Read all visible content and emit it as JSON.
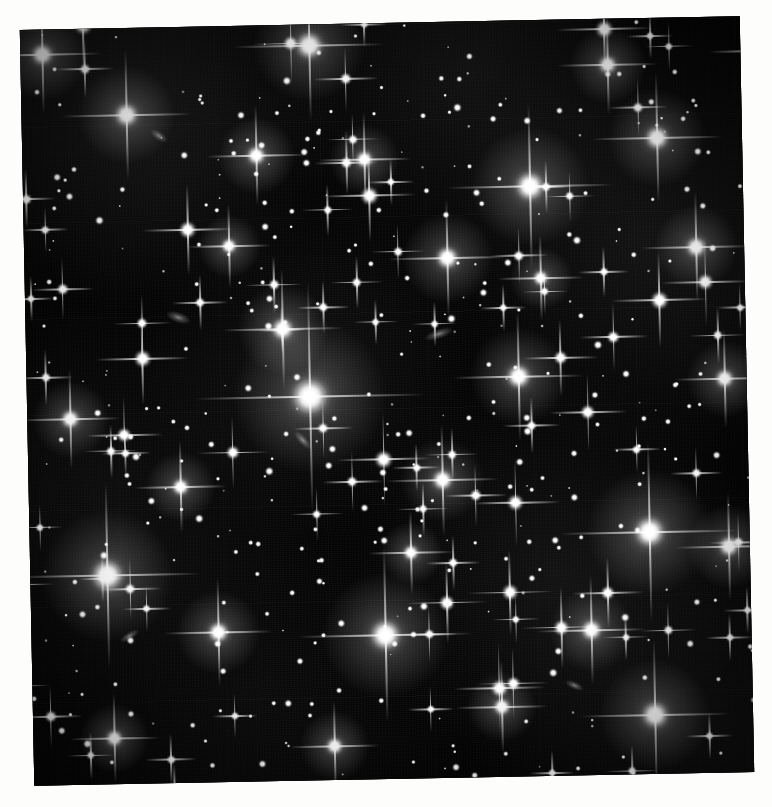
{
  "media": {
    "kind": "astronomical-photograph",
    "subject": "dense globular star cluster field",
    "caption": "",
    "border_color": "#fdfdfc",
    "sky_color": "#030303",
    "star_color": "#ffffff",
    "rotation_degrees": -1.1,
    "plate": {
      "left": 27,
      "top": 23,
      "width": 720,
      "height": 756
    }
  },
  "chart_data": {
    "type": "scatter",
    "title": "",
    "xlabel": "",
    "ylabel": "",
    "xlim": [
      0,
      748
    ],
    "ylim": [
      0,
      780
    ],
    "grid": false,
    "legend": "none",
    "series": [
      {
        "name": "bright stars with diffraction spikes",
        "points": [
          {
            "x": 303,
            "y": 31,
            "r": 16,
            "spike": 150
          },
          {
            "x": 521,
            "y": 176,
            "r": 17,
            "spike": 165
          },
          {
            "x": 297,
            "y": 382,
            "r": 22,
            "spike": 230
          },
          {
            "x": 91,
            "y": 557,
            "r": 19,
            "spike": 185
          },
          {
            "x": 368,
            "y": 622,
            "r": 18,
            "spike": 175
          },
          {
            "x": 634,
            "y": 524,
            "r": 18,
            "spike": 180
          },
          {
            "x": 636,
            "y": 707,
            "r": 16,
            "spike": 150
          },
          {
            "x": 119,
            "y": 97,
            "r": 14,
            "spike": 130
          },
          {
            "x": 36,
            "y": 35,
            "r": 13,
            "spike": 120
          },
          {
            "x": 271,
            "y": 314,
            "r": 13,
            "spike": 120
          },
          {
            "x": 506,
            "y": 366,
            "r": 14,
            "spike": 130
          },
          {
            "x": 649,
            "y": 130,
            "r": 14,
            "spike": 130
          },
          {
            "x": 437,
            "y": 246,
            "r": 13,
            "spike": 118
          },
          {
            "x": 201,
            "y": 616,
            "r": 12,
            "spike": 108
          },
          {
            "x": 686,
            "y": 240,
            "r": 12,
            "spike": 110
          },
          {
            "x": 57,
            "y": 400,
            "r": 11,
            "spike": 100
          },
          {
            "x": 428,
            "y": 468,
            "r": 12,
            "spike": 112
          },
          {
            "x": 574,
            "y": 621,
            "r": 12,
            "spike": 110
          },
          {
            "x": 713,
            "y": 540,
            "r": 12,
            "spike": 108
          },
          {
            "x": 248,
            "y": 140,
            "r": 11,
            "spike": 100
          },
          {
            "x": 356,
            "y": 146,
            "r": 10,
            "spike": 94
          },
          {
            "x": 601,
            "y": 56,
            "r": 11,
            "spike": 100
          },
          {
            "x": 166,
            "y": 470,
            "r": 10,
            "spike": 92
          },
          {
            "x": 483,
            "y": 696,
            "r": 10,
            "spike": 92
          },
          {
            "x": 712,
            "y": 372,
            "r": 11,
            "spike": 100
          },
          {
            "x": 95,
            "y": 720,
            "r": 10,
            "spike": 90
          },
          {
            "x": 315,
            "y": 732,
            "r": 10,
            "spike": 90
          },
          {
            "x": 530,
            "y": 268,
            "r": 9,
            "spike": 86
          },
          {
            "x": 219,
            "y": 230,
            "r": 9,
            "spike": 84
          },
          {
            "x": 395,
            "y": 540,
            "r": 9,
            "spike": 84
          }
        ]
      },
      {
        "name": "field stars",
        "count": 520
      },
      {
        "name": "background galaxies",
        "points": [
          {
            "x": 151,
            "y": 118,
            "w": 20,
            "h": 9,
            "angle": 35
          },
          {
            "x": 167,
            "y": 300,
            "w": 26,
            "h": 11,
            "angle": 20
          },
          {
            "x": 427,
            "y": 322,
            "w": 30,
            "h": 10,
            "angle": -18
          },
          {
            "x": 289,
            "y": 425,
            "w": 24,
            "h": 9,
            "angle": 48
          },
          {
            "x": 112,
            "y": 618,
            "w": 22,
            "h": 8,
            "angle": -30
          },
          {
            "x": 556,
            "y": 676,
            "w": 20,
            "h": 8,
            "angle": 25
          }
        ]
      }
    ]
  }
}
